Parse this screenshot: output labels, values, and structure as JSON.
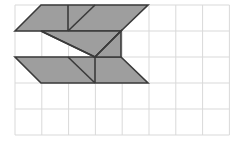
{
  "canvas": {
    "width": 237,
    "height": 143,
    "background_color": "#ffffff",
    "title": "Tangram figure on square grid"
  },
  "grid": {
    "name": "square-grid",
    "origin_x": 15,
    "origin_y": 5,
    "cell_width": 26.8,
    "cell_height": 26,
    "columns": 8,
    "rows": 5,
    "line_color": "#d9d9d9",
    "line_width": 1,
    "border_color": "#d9d9d9"
  },
  "figure": {
    "name": "tangram-z-figure",
    "fill_color": "#9e9e9e",
    "stroke_color": "#3a3a3a",
    "stroke_width": 1.6,
    "pieces": [
      {
        "name": "top-parallelogram",
        "type": "parallelogram",
        "points": "15,31 41,5 148,5 121,31"
      },
      {
        "name": "bottom-parallelogram",
        "type": "parallelogram",
        "points": "15,57 121,57 148,83 41,83"
      },
      {
        "name": "upper-middle-triangle",
        "type": "triangle",
        "points": "41,31 121,31 95,57"
      },
      {
        "name": "lower-middle-triangle",
        "type": "triangle",
        "points": "95,57 121,31 121,57"
      }
    ],
    "interior_lines": [
      {
        "name": "line-top-vertical-a",
        "x1": 68,
        "y1": 5,
        "x2": 68,
        "y2": 31
      },
      {
        "name": "line-top-diagonal",
        "x1": 95,
        "y1": 5,
        "x2": 68,
        "y2": 31
      },
      {
        "name": "line-bottom-vertical-a",
        "x1": 95,
        "y1": 57,
        "x2": 95,
        "y2": 83
      },
      {
        "name": "line-bottom-diagonal",
        "x1": 68,
        "y1": 57,
        "x2": 95,
        "y2": 83
      },
      {
        "name": "line-center-diagonal",
        "x1": 121,
        "y1": 31,
        "x2": 95,
        "y2": 57
      },
      {
        "name": "line-upper-left-diagonal",
        "x1": 41,
        "y1": 31,
        "x2": 95,
        "y2": 57
      }
    ]
  }
}
